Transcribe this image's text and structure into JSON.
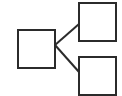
{
  "diagram": {
    "type": "hierarchy-icon",
    "background": "#ffffff",
    "stroke_color": "#2b2b2b",
    "fill_color": "#ffffff",
    "nodes": [
      {
        "id": "parent",
        "x": 18,
        "y": 30,
        "w": 37,
        "h": 38
      },
      {
        "id": "child-top",
        "x": 79,
        "y": 3,
        "w": 37,
        "h": 38
      },
      {
        "id": "child-bottom",
        "x": 79,
        "y": 57,
        "w": 37,
        "h": 38
      }
    ],
    "edges": [
      {
        "from": "parent",
        "to": "child-top",
        "x1": 55,
        "y1": 45,
        "x2": 79,
        "y2": 24
      },
      {
        "from": "parent",
        "to": "child-bottom",
        "x1": 55,
        "y1": 45,
        "x2": 79,
        "y2": 72
      }
    ]
  }
}
